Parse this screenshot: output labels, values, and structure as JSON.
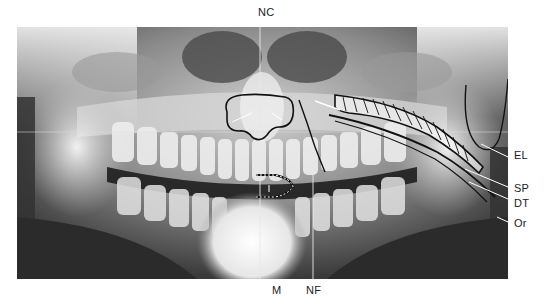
{
  "figure": {
    "type": "panoramic dental radiograph",
    "labels": {
      "top": [
        {
          "id": "NC",
          "text": "NC",
          "x": 258,
          "y": 6
        }
      ],
      "bottom": [
        {
          "id": "M",
          "text": "M",
          "x": 272,
          "y": 284
        },
        {
          "id": "NF",
          "text": "NF",
          "x": 306,
          "y": 284
        }
      ],
      "right": [
        {
          "id": "EL",
          "text": "EL",
          "x": 514,
          "y": 149
        },
        {
          "id": "SP",
          "text": "SP",
          "x": 514,
          "y": 182
        },
        {
          "id": "DT",
          "text": "DT",
          "x": 514,
          "y": 197
        },
        {
          "id": "Or",
          "text": "Or",
          "x": 514,
          "y": 217
        }
      ]
    },
    "colors": {
      "background": "#ffffff",
      "film_dark": "#2e2e2e",
      "bone_light": "#e8e8e8",
      "outline": "#111111",
      "pointer": "#ffffff",
      "label_text": "#222222"
    }
  }
}
